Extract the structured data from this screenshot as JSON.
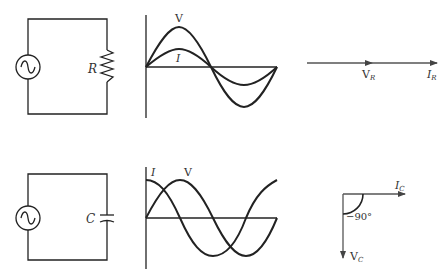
{
  "diagrams": [
    {
      "name": "resistive-circuit",
      "component_label": "R",
      "waveform_labels": {
        "voltage": "V",
        "current": "I"
      },
      "phasor_labels": {
        "voltage": "V",
        "voltage_sub": "R",
        "current": "I",
        "current_sub": "R"
      }
    },
    {
      "name": "capacitive-circuit",
      "component_label": "C",
      "waveform_labels": {
        "voltage": "V",
        "current": "I"
      },
      "phasor_labels": {
        "voltage": "V",
        "voltage_sub": "C",
        "current": "I",
        "current_sub": "C",
        "angle": "−90°"
      }
    }
  ],
  "colors": {
    "stroke": "#222222",
    "text": "#333333",
    "background": "#ffffff"
  }
}
